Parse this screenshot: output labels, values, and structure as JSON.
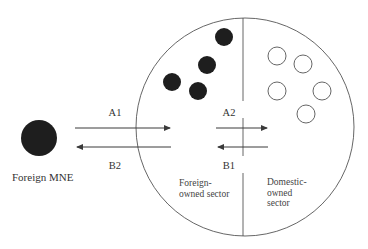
{
  "colors": {
    "background": "#ffffff",
    "stroke": "#3a3a3a",
    "firm_fill": "#1e1e1e",
    "hollow_fill": "#ffffff"
  },
  "diagram": {
    "host_economy": {
      "cx": 245,
      "cy": 127,
      "r": 109,
      "divider_x": 243
    },
    "foreign_mne": {
      "label": "Foreign MNE",
      "cx": 39,
      "cy": 138,
      "r": 18
    },
    "foreign_owned_sector": {
      "label": "Foreign-\nowned sector",
      "firms": [
        {
          "cx": 224,
          "cy": 37,
          "r": 9
        },
        {
          "cx": 207,
          "cy": 65,
          "r": 9
        },
        {
          "cx": 172,
          "cy": 82,
          "r": 9
        },
        {
          "cx": 198,
          "cy": 91,
          "r": 9
        }
      ]
    },
    "domestic_owned_sector": {
      "label": "Domestic-\nowned\nsector",
      "firms": [
        {
          "cx": 277,
          "cy": 56,
          "r": 9
        },
        {
          "cx": 303,
          "cy": 64,
          "r": 9
        },
        {
          "cx": 277,
          "cy": 91,
          "r": 9
        },
        {
          "cx": 322,
          "cy": 91,
          "r": 9
        },
        {
          "cx": 306,
          "cy": 114,
          "r": 9
        }
      ]
    },
    "flows": [
      {
        "id": "A1",
        "label": "A1",
        "direction": "right",
        "x1": 75,
        "x2": 171,
        "y": 128
      },
      {
        "id": "B2",
        "label": "B2",
        "direction": "left",
        "x1": 171,
        "x2": 76,
        "y": 147
      },
      {
        "id": "A2",
        "label": "A2",
        "direction": "right",
        "x1": 216,
        "x2": 268,
        "y": 128
      },
      {
        "id": "B1",
        "label": "B1",
        "direction": "left",
        "x1": 268,
        "x2": 217,
        "y": 147
      }
    ]
  }
}
